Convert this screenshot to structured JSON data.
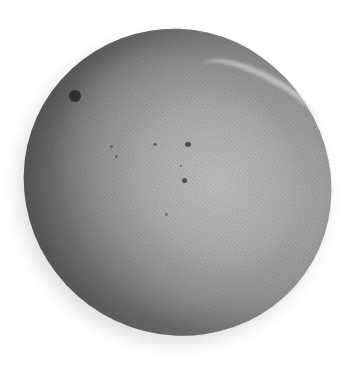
{
  "image": {
    "subject": "mango",
    "style": "grayscale photograph",
    "background": "#ffffff",
    "colors": {
      "fruit_light": "#bdbdbd",
      "fruit_mid": "#aaaaaa",
      "fruit_dark": "#6f6f6f",
      "spots": "#2f2f2f"
    }
  }
}
